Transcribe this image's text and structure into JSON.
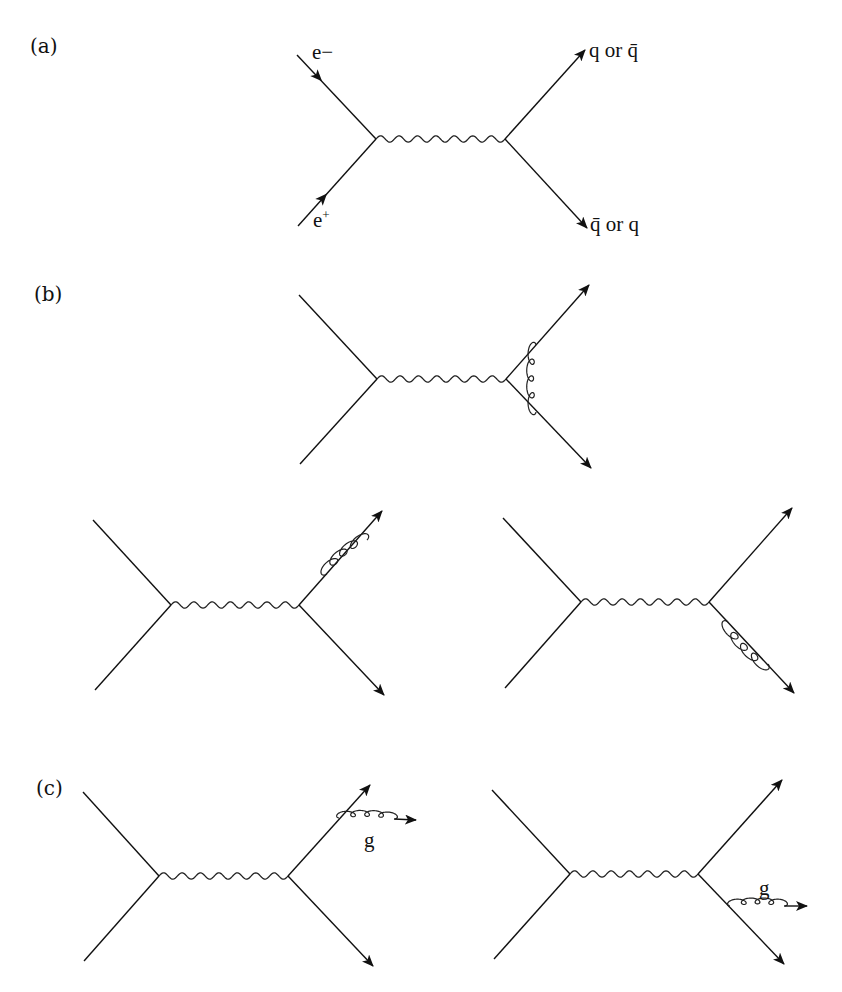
{
  "figure": {
    "panels": [
      {
        "id": "a",
        "label": "(a)",
        "description": "Lowest-order e+e- annihilation to quark-antiquark via virtual photon",
        "labels": {
          "electron": "e−",
          "positron": "e+",
          "out_top": "q or q̄",
          "out_bottom": "q̄ or q"
        }
      },
      {
        "id": "b",
        "label": "(b)",
        "description": "Virtual gluon corrections: vertex correction and self-energy on each outgoing quark line",
        "diagrams": [
          "vertex-gluon-exchange",
          "self-energy-upper-quark",
          "self-energy-lower-quark"
        ]
      },
      {
        "id": "c",
        "label": "(c)",
        "description": "Real gluon emission from outgoing quark or antiquark",
        "diagrams": [
          {
            "emitter": "upper-quark",
            "gluon_label": "g"
          },
          {
            "emitter": "lower-quark",
            "gluon_label": "g"
          }
        ]
      }
    ]
  }
}
